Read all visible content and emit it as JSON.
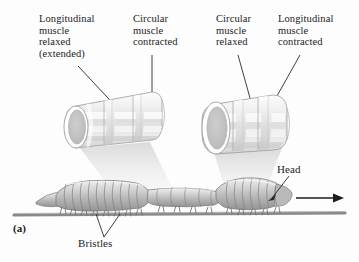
{
  "figure": {
    "panel_label": "(a)",
    "background_color": "#fdfdfd",
    "ink_color": "#1c1c1c",
    "cylinder_fill": "#ededed",
    "worm_fill": "#c9c9c9",
    "ground_color": "#8a8a8a"
  },
  "labels": {
    "left_longitudinal": "Longitudinal\nmuscle\nrelaxed\n(extended)",
    "left_circular": "Circular\nmuscle\ncontracted",
    "right_circular": "Circular\nmuscle\nrelaxed",
    "right_longitudinal": "Longitudinal\nmuscle\ncontracted",
    "head": "Head",
    "bristles": "Bristles"
  },
  "diagram": {
    "left_cylinder_name": "elongated-narrow-segment",
    "right_cylinder_name": "shortened-wide-segment",
    "movement_direction": "right",
    "worm_name": "earthworm-body"
  }
}
